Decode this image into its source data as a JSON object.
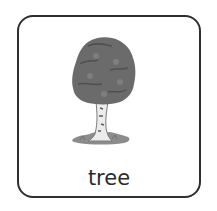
{
  "card": {
    "label": "tree",
    "icon": "tree-icon",
    "colors": {
      "border": "#2f2f2f",
      "canopy": "#6b6b6b",
      "trunk": "#e8e8e8",
      "ground": "#8a8a8a",
      "text": "#2b2b2b"
    }
  }
}
